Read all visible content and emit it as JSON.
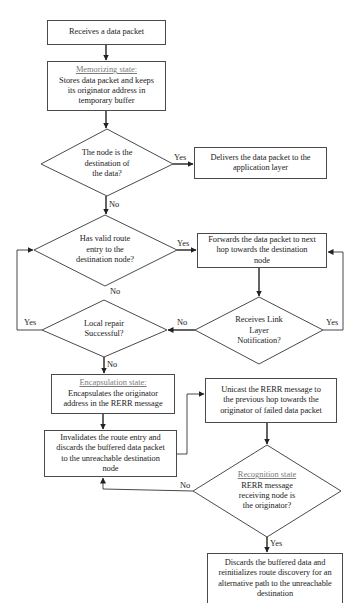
{
  "flowchart": {
    "nodes": {
      "receive": {
        "text": "Receives a data packet"
      },
      "memorize": {
        "heading": "Memorizing state:",
        "text": "Stores data packet and keeps\nits originator address in\ntemporary buffer"
      },
      "is_destination": {
        "text": "The node is the\ndestination of\nthe data?"
      },
      "deliver": {
        "text": "Delivers the data packet to the\napplication layer"
      },
      "valid_route": {
        "text": "Has valid route\nentry to the\ndestination node?"
      },
      "forward": {
        "text": "Forwards the data packet to next\nhop towards the destination\nnode"
      },
      "link_notification": {
        "text": "Receives Link\nLayer\nNotification?"
      },
      "local_repair": {
        "text": "Local repair\nSuccessful?"
      },
      "encapsulation": {
        "heading": "Encapsulation state:",
        "text": "Encapsulates the originator\naddress in the RERR message"
      },
      "invalidate": {
        "text": "Invalidates the route entry and\ndiscards the buffered data packet\nto the unreachable destination\nnode"
      },
      "unicast": {
        "text": "Unicast the RERR message to\nthe previous hop towards the\noriginator of failed data packet"
      },
      "recognition": {
        "heading": "Recognition state",
        "text": "RERR message\nreceiving node is\nthe originator?"
      },
      "discard": {
        "text": "Discards the buffered data and\nreinitializes route discovery for an\nalternative path to the unreachable\ndestination"
      }
    },
    "edge_labels": {
      "destination_yes": "Yes",
      "destination_no": "No",
      "route_yes": "Yes",
      "route_no": "No",
      "link_no": "No",
      "link_yes": "Yes",
      "repair_yes": "Yes",
      "repair_no": "No",
      "recognition_no": "No",
      "recognition_yes": "Yes"
    }
  },
  "colors": {
    "line": "#333333",
    "text": "#222222",
    "heading": "#7a7a7a",
    "background": "#ffffff"
  }
}
